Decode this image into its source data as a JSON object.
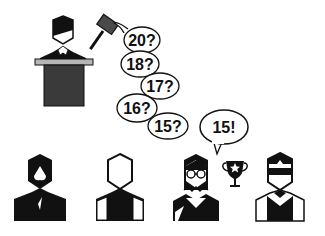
{
  "scene": {
    "title": "Auction illustration",
    "colors": {
      "ink": "#111111",
      "podium": "#3a3a3a",
      "podium_top": "#b5b5b5",
      "gavel": "#4a4a4a",
      "background": "#ffffff"
    }
  },
  "auctioneer": {
    "label": "auctioneer",
    "icons": [
      "gavel-icon",
      "podium-icon"
    ]
  },
  "bids": [
    {
      "label": "20?"
    },
    {
      "label": "18?"
    },
    {
      "label": "17?"
    },
    {
      "label": "16?"
    },
    {
      "label": "15?"
    }
  ],
  "winning_bid": {
    "label": "15!"
  },
  "bidders": [
    {
      "name": "bidder-bearded-man"
    },
    {
      "name": "bidder-outline-man"
    },
    {
      "name": "bidder-woman-glasses",
      "winner": true,
      "icon": "trophy-icon"
    },
    {
      "name": "bidder-sunglasses-man"
    }
  ]
}
